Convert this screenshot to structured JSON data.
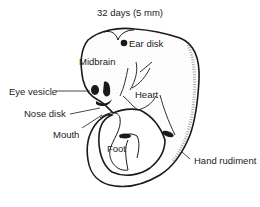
{
  "title": "32 days  (5 mm)",
  "labels": {
    "ear_disk": "Ear disk",
    "midbrain": "Midbrain",
    "eye_vesicle": "Eye vesicle",
    "heart": "Heart",
    "nose_disk": "Nose disk",
    "mouth": "Mouth",
    "foot": "Foot",
    "hand_rudiment": "Hand rudiment"
  },
  "colors": {
    "ink": "#1a1a1a",
    "stipple": "#9a9a9a",
    "background": "#ffffff"
  }
}
